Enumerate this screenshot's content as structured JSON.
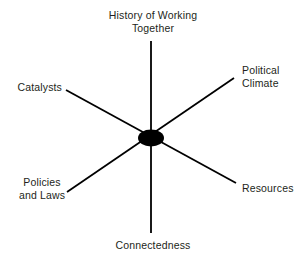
{
  "figure": {
    "type": "radial-spoke-diagram",
    "background_color": "#ffffff",
    "line_color": "#000000",
    "text_color": "#231f20",
    "hub": {
      "shape": "ellipse",
      "fill": "#000000",
      "cx": 151,
      "cy": 138,
      "rx": 13,
      "ry": 8.5
    },
    "axes": [
      {
        "name": "vertical-axis",
        "x1": 151,
        "y1": 41,
        "x2": 151,
        "y2": 233,
        "stroke_width": 1.8
      },
      {
        "name": "nw-se-axis",
        "x1": 66,
        "y1": 90,
        "x2": 236,
        "y2": 183,
        "stroke_width": 1.8
      },
      {
        "name": "sw-ne-axis",
        "x1": 67,
        "y1": 192,
        "x2": 234,
        "y2": 78,
        "stroke_width": 1.8
      }
    ],
    "labels": {
      "history": "History of Working\nTogether",
      "political_climate": "Political\nClimate",
      "catalysts": "Catalysts",
      "policies_and_laws": "Policies\nand Laws",
      "resources": "Resources",
      "connectedness": "Connectedness"
    }
  }
}
